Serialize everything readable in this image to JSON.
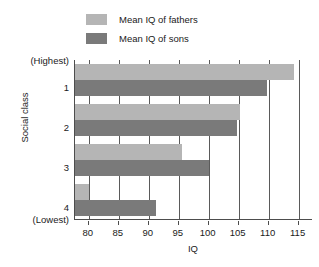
{
  "chart_data": {
    "type": "bar",
    "orientation": "horizontal",
    "title": "",
    "xlabel": "IQ",
    "ylabel": "Social class",
    "xlim": [
      77.7,
      117.4
    ],
    "xticks": [
      80,
      85,
      90,
      95,
      100,
      105,
      110,
      115
    ],
    "xtick_labels": [
      "80",
      "85",
      "90",
      "95",
      "100",
      "105",
      "110",
      "115"
    ],
    "grid": "vertical",
    "legend_position": "top-left",
    "categories": [
      "1",
      "2",
      "3",
      "4"
    ],
    "ytick_labels": [
      "(Highest)",
      "1",
      "2",
      "3",
      "4",
      "(Lowest)"
    ],
    "series": [
      {
        "name": "Mean IQ of fathers",
        "color": "#b5b5b5",
        "values": [
          114.2,
          105.2,
          95.5,
          80.0
        ]
      },
      {
        "name": "Mean IQ of sons",
        "color": "#7a7a7a",
        "values": [
          109.8,
          104.7,
          100.0,
          91.2
        ]
      }
    ]
  },
  "legend": {
    "items": [
      {
        "label": "Mean IQ of fathers",
        "color": "#b5b5b5"
      },
      {
        "label": "Mean IQ of sons",
        "color": "#7a7a7a"
      }
    ]
  },
  "axes": {
    "x_title": "IQ",
    "y_title": "Social class"
  },
  "colors": {
    "fathers": "#b5b5b5",
    "sons": "#7a7a7a",
    "axis": "#4d4d4d",
    "grid": "#5a5a5a",
    "text": "#1a1a1a",
    "background": "#ffffff"
  }
}
